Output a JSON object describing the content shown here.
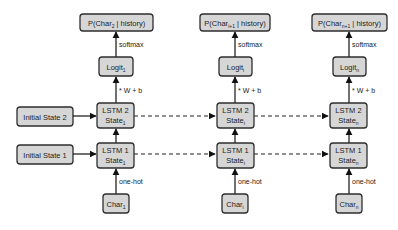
{
  "diagram": {
    "initial_states": [
      {
        "label": "Initial State 2"
      },
      {
        "label": "Initial State 1"
      }
    ],
    "columns": [
      {
        "output": {
          "prefix": "P(Char",
          "sub": "2",
          "suffix": " | history)"
        },
        "logit": {
          "prefix": "Logit",
          "sub": "1"
        },
        "lstm2": {
          "line1": "LSTM 2",
          "prefix": "State",
          "sub": "1"
        },
        "lstm1": {
          "line1": "LSTM 1",
          "prefix": "State",
          "sub": "1"
        },
        "input": {
          "prefix": "Char",
          "sub": "1"
        }
      },
      {
        "output": {
          "prefix": "P(Char",
          "sub": "i+1",
          "suffix": " | history)"
        },
        "logit": {
          "prefix": "Logit",
          "sub": "i"
        },
        "lstm2": {
          "line1": "LSTM 2",
          "prefix": "State",
          "sub": "i"
        },
        "lstm1": {
          "line1": "LSTM 1",
          "prefix": "State",
          "sub": "i"
        },
        "input": {
          "prefix": "Char",
          "sub": "i"
        }
      },
      {
        "output": {
          "prefix": "P(Char",
          "sub": "n+1",
          "suffix": " | history)"
        },
        "logit": {
          "prefix": "Logit",
          "sub": "n"
        },
        "lstm2": {
          "line1": "LSTM 2",
          "prefix": "State",
          "sub": "n"
        },
        "lstm1": {
          "line1": "LSTM 1",
          "prefix": "State",
          "sub": "n"
        },
        "input": {
          "prefix": "Char",
          "sub": "n"
        }
      }
    ],
    "edge_labels": {
      "softmax": "softmax",
      "affine": "* W + b",
      "one_hot": "one-hot"
    },
    "colors": {
      "box_fill": "#d6d6d6",
      "box_stroke": "#2e2e2e",
      "arrow": "#111111"
    }
  }
}
